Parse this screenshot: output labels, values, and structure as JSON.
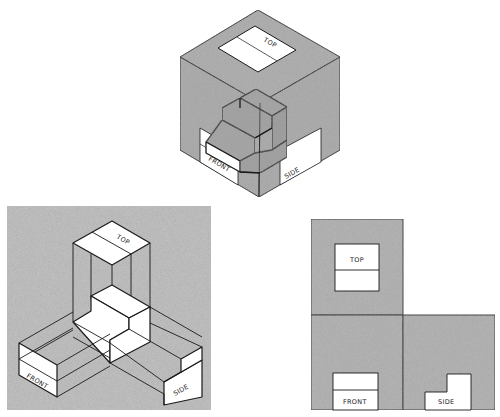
{
  "figure": {
    "colors": {
      "background": "#ffffff",
      "shaded_face": "#b2b2b2",
      "panel_gray": "#c4c4c4",
      "line": "#1a1a1a",
      "view_window": "#ffffff"
    }
  },
  "isometric_cube": {
    "labels": {
      "top": "TOP",
      "front": "FRONT",
      "side": "SIDE"
    }
  },
  "unfolded_box": {
    "labels": {
      "top": "TOP",
      "front": "FRONT",
      "side": "SIDE"
    }
  },
  "flat_views": {
    "labels": {
      "top": "TOP",
      "front": "FRONT",
      "side": "SIDE"
    }
  }
}
